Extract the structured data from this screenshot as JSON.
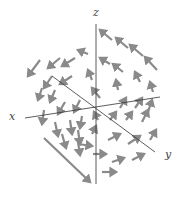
{
  "diagram": {
    "type": "3d-vector-field",
    "axes": {
      "x": {
        "label": "x",
        "from": [
          25,
          118
        ],
        "to": [
          160,
          97
        ]
      },
      "y": {
        "label": "y",
        "from": [
          52,
          76
        ],
        "to": [
          155,
          152
        ]
      },
      "z": {
        "label": "z",
        "from": [
          96,
          24
        ],
        "to": [
          96,
          184
        ]
      }
    },
    "colors": {
      "axis": "#333333",
      "arrow": "#8a8a8a",
      "label": "#444444"
    },
    "arrows": [
      [
        112,
        40,
        100,
        30
      ],
      [
        128,
        48,
        116,
        38
      ],
      [
        143,
        56,
        130,
        45
      ],
      [
        157,
        70,
        145,
        57
      ],
      [
        88,
        54,
        78,
        50
      ],
      [
        110,
        64,
        100,
        58
      ],
      [
        123,
        72,
        113,
        64
      ],
      [
        140,
        82,
        135,
        72
      ],
      [
        153,
        92,
        150,
        82
      ],
      [
        40,
        60,
        28,
        76
      ],
      [
        60,
        58,
        48,
        68
      ],
      [
        75,
        58,
        62,
        66
      ],
      [
        72,
        76,
        60,
        84
      ],
      [
        52,
        76,
        44,
        88
      ],
      [
        92,
        80,
        88,
        70
      ],
      [
        118,
        90,
        116,
        80
      ],
      [
        42,
        88,
        38,
        100
      ],
      [
        55,
        90,
        50,
        102
      ],
      [
        65,
        102,
        58,
        114
      ],
      [
        80,
        100,
        74,
        112
      ],
      [
        100,
        98,
        92,
        88
      ],
      [
        120,
        108,
        126,
        98
      ],
      [
        135,
        108,
        142,
        98
      ],
      [
        148,
        112,
        152,
        100
      ],
      [
        44,
        110,
        42,
        124
      ],
      [
        55,
        122,
        58,
        136
      ],
      [
        70,
        120,
        72,
        134
      ],
      [
        82,
        116,
        80,
        128
      ],
      [
        98,
        120,
        94,
        112
      ],
      [
        110,
        120,
        116,
        112
      ],
      [
        126,
        120,
        132,
        112
      ],
      [
        142,
        122,
        148,
        110
      ],
      [
        62,
        134,
        66,
        148
      ],
      [
        78,
        130,
        80,
        144
      ],
      [
        92,
        134,
        96,
        126
      ],
      [
        108,
        140,
        120,
        134
      ],
      [
        128,
        144,
        140,
        136
      ],
      [
        150,
        140,
        156,
        130
      ],
      [
        78,
        144,
        92,
        146
      ],
      [
        93,
        154,
        106,
        154
      ],
      [
        112,
        162,
        124,
        158
      ],
      [
        132,
        160,
        144,
        154
      ],
      [
        102,
        172,
        116,
        172
      ],
      [
        44,
        138,
        90,
        182
      ],
      [
        78,
        142,
        80,
        155
      ]
    ]
  }
}
